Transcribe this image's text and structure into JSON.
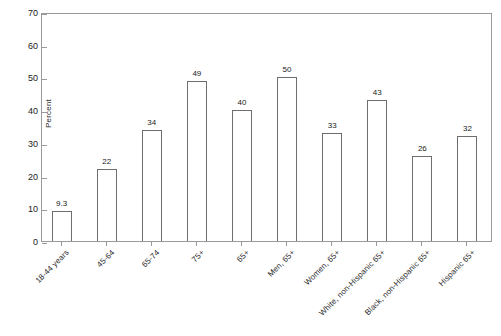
{
  "chart_data": {
    "type": "bar",
    "title": "",
    "subtitle": "",
    "xlabel": "",
    "ylabel": "Percent",
    "ylim": [
      0,
      70
    ],
    "ytick_step": 10,
    "yticks": [
      0,
      10,
      20,
      30,
      40,
      50,
      60,
      70
    ],
    "ytick_labels": [
      "0",
      "10",
      "20",
      "30",
      "40",
      "50",
      "60",
      "70"
    ],
    "grid": false,
    "legend": null,
    "categories": [
      "18-44 years",
      "45-64",
      "65-74",
      "75+",
      "65+",
      "Men, 65+",
      "Women, 65+",
      "White, non-Hispanic 65+",
      "Black, non-Hispanic 65+",
      "Hispanic 65+"
    ],
    "values": [
      9.3,
      22,
      34,
      49,
      40,
      50,
      33,
      43,
      26,
      32
    ],
    "value_labels": [
      "9.3",
      "22",
      "34",
      "49",
      "40",
      "50",
      "33",
      "43",
      "26",
      "32"
    ],
    "bar_style": {
      "fill": "#ffffff",
      "border": "#6e6e6e"
    },
    "frame_color": "#9a9a9a",
    "text_color": "#1a1a1a"
  }
}
